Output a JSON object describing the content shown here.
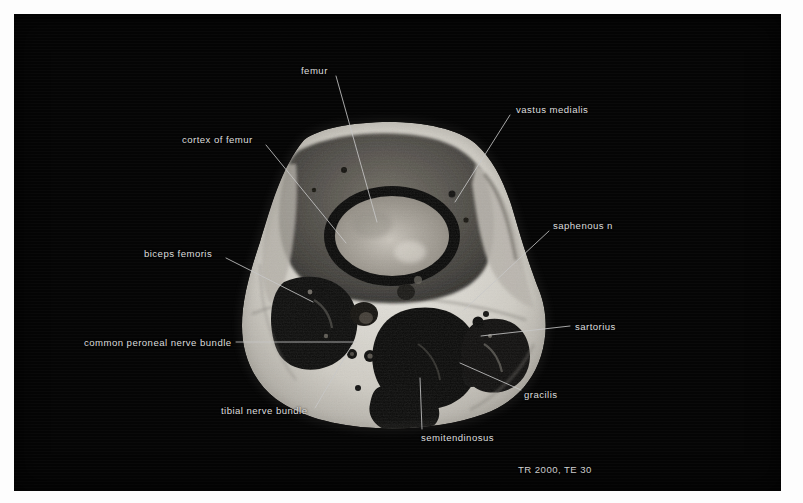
{
  "image": {
    "modality": "MRI",
    "view": "axial cross-section of distal thigh",
    "background_color": "#050505",
    "label_color": "#dcdcdc",
    "leader_color": "#c8c8c8",
    "border_color": "#ffffff"
  },
  "scan_parameters": {
    "text": "TR 2000, TE 30",
    "tr": "TR 2000",
    "te": "TE 30",
    "x": 518,
    "y": 465
  },
  "annotations": [
    {
      "id": "femur",
      "label": "femur",
      "align": "left",
      "text_x": 301,
      "text_y": 66,
      "leader": [
        [
          336,
          76
        ],
        [
          377,
          222
        ]
      ]
    },
    {
      "id": "cortex-of-femur",
      "label": "cortex of femur",
      "align": "left",
      "text_x": 182,
      "text_y": 135,
      "leader": [
        [
          266,
          145
        ],
        [
          346,
          243
        ]
      ]
    },
    {
      "id": "vastus-medialis",
      "label": "vastus medialis",
      "align": "left",
      "text_x": 516,
      "text_y": 105,
      "leader": [
        [
          510,
          115
        ],
        [
          455,
          202
        ]
      ]
    },
    {
      "id": "saphenous-n",
      "label": "saphenous n",
      "align": "left",
      "text_x": 553,
      "text_y": 221,
      "leader": [
        [
          549,
          231
        ],
        [
          464,
          310
        ]
      ]
    },
    {
      "id": "biceps-femoris",
      "label": "biceps femoris",
      "align": "left",
      "text_x": 144,
      "text_y": 249,
      "leader": [
        [
          226,
          258
        ],
        [
          313,
          302
        ]
      ]
    },
    {
      "id": "sartorius",
      "label": "sartorius",
      "align": "left",
      "text_x": 575,
      "text_y": 322,
      "leader": [
        [
          570,
          326
        ],
        [
          481,
          336
        ]
      ]
    },
    {
      "id": "common-peroneal-nerve-bundle",
      "label": "common peroneal nerve bundle",
      "align": "left",
      "text_x": 84,
      "text_y": 338,
      "leader": [
        [
          236,
          342
        ],
        [
          356,
          342
        ]
      ]
    },
    {
      "id": "gracilis",
      "label": "gracilis",
      "align": "left",
      "text_x": 524,
      "text_y": 390,
      "leader": [
        [
          521,
          390
        ],
        [
          460,
          363
        ]
      ]
    },
    {
      "id": "tibial-nerve-bundle",
      "label": "tibial nerve bundle",
      "align": "left",
      "text_x": 221,
      "text_y": 406,
      "leader": [
        [
          315,
          408
        ],
        [
          352,
          345
        ]
      ]
    },
    {
      "id": "semitendinosus",
      "label": "semitendinosus",
      "align": "left",
      "text_x": 421,
      "text_y": 433,
      "leader": [
        [
          420,
          378
        ],
        [
          422,
          429
        ]
      ]
    }
  ]
}
